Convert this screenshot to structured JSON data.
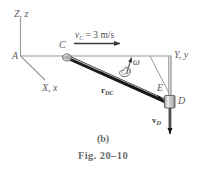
{
  "figure": {
    "caption_part": "(b)",
    "caption_fig": "Fig. 20–10",
    "axes": {
      "z_label_main": "Z",
      "z_label_sub": ", z",
      "y_label_main": "Y",
      "y_label_sub": ", y",
      "x_label_main": "X",
      "x_label_sub": ", x"
    },
    "points": {
      "origin": "A",
      "collar_c": "C",
      "point_e": "E",
      "collar_d": "D"
    },
    "annotations": {
      "velocity_c_symbol": "v",
      "velocity_c_subscript": "C",
      "velocity_c_value": "= 3 m/s",
      "velocity_c_full": "v_C = 3 m/s",
      "angular_velocity": "ω",
      "position_vector_symbol": "r",
      "position_vector_subscript": "DC",
      "velocity_d_symbol": "v",
      "velocity_d_subscript": "D"
    },
    "colors": {
      "line": "#8d8d8f",
      "rod": "#2b2b2d",
      "text": "#58585a",
      "collar_fill": "#d8d8da",
      "arrow": "#3a3a3c"
    }
  }
}
